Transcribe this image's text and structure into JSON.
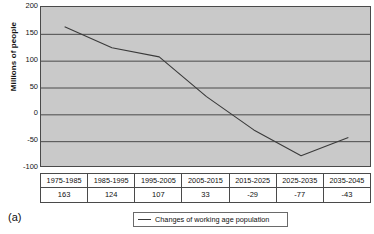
{
  "panel_label": "(a)",
  "axis": {
    "ylabel": "Millions of people",
    "yticks": [
      "200",
      "150",
      "100",
      "50",
      "0",
      "-50",
      "-100"
    ]
  },
  "legend": {
    "series_label": "Changes of working age population",
    "swatch": "line-swatch"
  },
  "table": {
    "periods": [
      "1975-1985",
      "1985-1995",
      "1995-2005",
      "2005-2015",
      "2015-2025",
      "2025-2035",
      "2035-2045"
    ],
    "values": [
      "163",
      "124",
      "107",
      "33",
      "-29",
      "-77",
      "-43"
    ]
  },
  "chart_data": {
    "type": "line",
    "title": "",
    "xlabel": "",
    "ylabel": "Millions of people",
    "categories": [
      "1975-1985",
      "1985-1995",
      "1995-2005",
      "2005-2015",
      "2015-2025",
      "2025-2035",
      "2035-2045"
    ],
    "series": [
      {
        "name": "Changes of working age population",
        "values": [
          163,
          124,
          107,
          33,
          -29,
          -77,
          -43
        ],
        "color": "#3a3a3a"
      }
    ],
    "ylim": [
      -100,
      200
    ],
    "ytick_step": 50,
    "yticks": [
      200,
      150,
      100,
      50,
      0,
      -50,
      -100
    ],
    "grid": "horizontal",
    "legend_position": "bottom-center",
    "plot_background": "#c9c9c9"
  }
}
